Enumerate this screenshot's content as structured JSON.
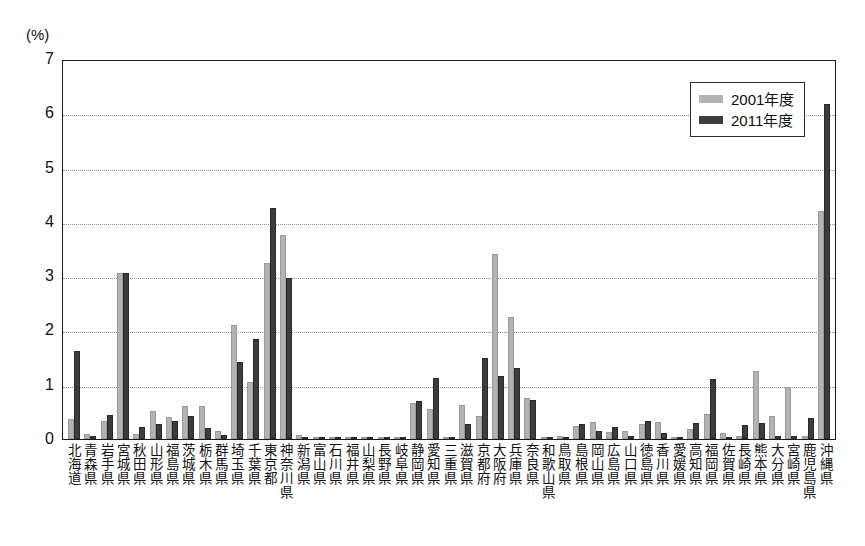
{
  "chart_data": {
    "type": "bar",
    "title": "",
    "subtitle": "",
    "xlabel": "",
    "ylabel": "(%)",
    "unit_label": "(%)",
    "ylim": [
      0,
      7
    ],
    "yticks": [
      7,
      6,
      5,
      4,
      3,
      2,
      1,
      0
    ],
    "ytick_labels": [
      "7",
      "6",
      "5",
      "4",
      "3",
      "2",
      "1",
      "0"
    ],
    "grid": true,
    "grid_axis": "y",
    "legend_position": "top-right",
    "colors": {
      "series_2001": "#b3b3b3",
      "series_2011": "#3c3c3c",
      "axis": "#1a1a1a",
      "grid": "#8d8d8d"
    },
    "categories": [
      "北海道",
      "青森県",
      "岩手県",
      "宮城県",
      "秋田県",
      "山形県",
      "福島県",
      "茨城県",
      "栃木県",
      "群馬県",
      "埼玉県",
      "千葉県",
      "東京都",
      "神奈川県",
      "新潟県",
      "富山県",
      "石川県",
      "福井県",
      "山梨県",
      "長野県",
      "岐阜県",
      "静岡県",
      "愛知県",
      "三重県",
      "滋賀県",
      "京都府",
      "大阪府",
      "兵庫県",
      "奈良県",
      "和歌山県",
      "鳥取県",
      "島根県",
      "岡山県",
      "広島県",
      "山口県",
      "徳島県",
      "香川県",
      "愛媛県",
      "高知県",
      "福岡県",
      "佐賀県",
      "長崎県",
      "熊本県",
      "大分県",
      "宮崎県",
      "鹿児島県",
      "沖縄県"
    ],
    "series": [
      {
        "name": "2001年度",
        "color": "#b3b3b3",
        "values": [
          0.36,
          0.1,
          0.33,
          3.05,
          0.1,
          0.52,
          0.4,
          0.6,
          0.6,
          0.15,
          2.1,
          1.05,
          3.25,
          3.75,
          0.08,
          0.0,
          0.0,
          0.0,
          0.0,
          0.0,
          0.0,
          0.67,
          0.55,
          0.0,
          0.62,
          0.43,
          3.4,
          2.25,
          0.75,
          0.0,
          0.05,
          0.24,
          0.32,
          0.13,
          0.14,
          0.27,
          0.32,
          0.0,
          0.18,
          0.46,
          0.12,
          0.05,
          1.25,
          0.42,
          0.95,
          0.05,
          4.2
        ]
      },
      {
        "name": "2011年度",
        "color": "#3c3c3c",
        "values": [
          1.62,
          0.06,
          0.45,
          3.05,
          0.22,
          0.28,
          0.33,
          0.42,
          0.2,
          0.07,
          1.42,
          1.85,
          4.25,
          2.97,
          0.03,
          0.0,
          0.0,
          0.0,
          0.0,
          0.0,
          0.0,
          0.7,
          1.12,
          0.0,
          0.28,
          1.5,
          1.17,
          1.3,
          0.72,
          0.0,
          0.0,
          0.28,
          0.15,
          0.22,
          0.05,
          0.33,
          0.12,
          0.0,
          0.3,
          1.1,
          0.0,
          0.25,
          0.3,
          0.05,
          0.05,
          0.38,
          6.18
        ]
      }
    ],
    "legend": [
      {
        "label": "2001年度",
        "color": "#b3b3b3",
        "key": "series_2001"
      },
      {
        "label": "2011年度",
        "color": "#3c3c3c",
        "key": "series_2011"
      }
    ]
  }
}
